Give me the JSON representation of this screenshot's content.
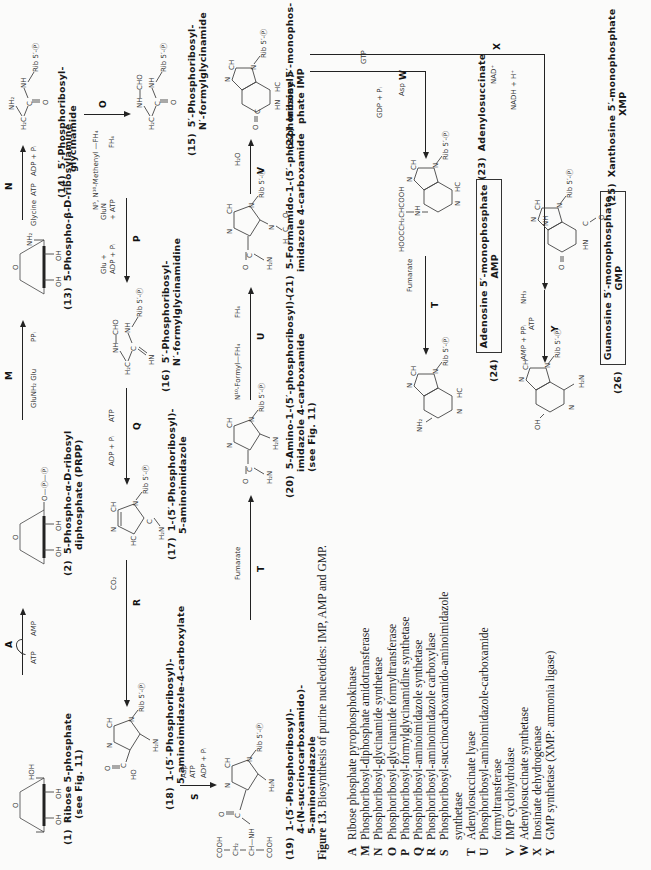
{
  "figure": {
    "number": "Figure 13.",
    "caption": "Biosynthesis of purine nucleotides: IMP, AMP and GMP.",
    "orientation": "page rotated 90° counter-clockwise"
  },
  "compounds": {
    "c1": {
      "num": "(1)",
      "line1": "Ribose 5-phosphate",
      "line2": "(see Fig. 11)"
    },
    "c2": {
      "num": "(2)",
      "line1": "5-Phospho-α-D-ribosyl",
      "line2": "diphosphate (PRPP)"
    },
    "c13": {
      "num": "(13)",
      "line1": "5-Phospho-β-D-ribosylamine"
    },
    "c14": {
      "num": "(14)",
      "line1": "5′-Phosphoribosyl-",
      "line2": "glycinamide"
    },
    "c15": {
      "num": "(15)",
      "line1": "5′-Phosphoribosyl-",
      "line2": "N′-formylglycinamide"
    },
    "c16": {
      "num": "(16)",
      "line1": "5′-Phosphoribosyl-",
      "line2": "N′-formylglycinamidine"
    },
    "c17": {
      "num": "(17)",
      "line1": "1-(5′-Phosphoribosyl)-",
      "line2": "5-aminoimidazole"
    },
    "c18": {
      "num": "(18)",
      "line1": "1-(5′-Phosphoribosyl)-",
      "line2": "5-aminoimidazole-4-carboxylate"
    },
    "c19": {
      "num": "(19)",
      "line1": "1-(5′-Phosphoribosyl)-",
      "line2": "4-(N-succinocarboxamido)-",
      "line3": "5-aminoimidazole"
    },
    "c20": {
      "num": "(20)",
      "line1": "5-Amino-1-(5′-phosphoribosyl)-",
      "line2": "imidazole 4-carboxamide",
      "line3": "(see Fig. 11)"
    },
    "c21": {
      "num": "(21)",
      "line1": "5-Formamido-1-(5′-phosphoribosyl)-",
      "line2": "imidazole 4-carboxamide"
    },
    "c22": {
      "num": "(22)",
      "line1": "Inosine 5′-monophos-",
      "line2": "phate IMP"
    },
    "c23": {
      "num": "(23)",
      "line1": "Adenylosuccinate"
    },
    "c24": {
      "num": "(24)",
      "line1": "Adenosine 5′-monophosphate",
      "line2": "AMP"
    },
    "c25": {
      "num": "(25)",
      "line1": "Xanthosine 5′-monophosphate",
      "line2": "XMP"
    },
    "c26": {
      "num": "(26)",
      "line1": "Guanosine 5′-monophosphate",
      "line2": "GMP"
    }
  },
  "reactions": {
    "A": {
      "enzyme": "A",
      "in": "ATP",
      "out": "AMP"
    },
    "M": {
      "enzyme": "M",
      "in": "GluNH₂",
      "in2": "Glu",
      "out": "PPᵢ"
    },
    "N": {
      "enzyme": "N",
      "in": "Glycine",
      "in2": "ATP",
      "out": "ADP + Pᵢ"
    },
    "O": {
      "enzyme": "O",
      "in": "N⁵, N¹⁰-Methenyl —FH₄",
      "out": "FH₄"
    },
    "P": {
      "enzyme": "P",
      "in": "GluN",
      "in2": "+ ATP",
      "out": "Glu +",
      "out2": "ADP + Pᵢ"
    },
    "Q": {
      "enzyme": "Q",
      "in": "ATP",
      "out": "ADP + Pᵢ"
    },
    "R": {
      "enzyme": "R",
      "in": "CO₂"
    },
    "S": {
      "enzyme": "S",
      "in": "Asp",
      "in2": "ATP",
      "out": "ADP + Pᵢ"
    },
    "T1": {
      "enzyme": "T",
      "out": "Fumarate"
    },
    "U": {
      "enzyme": "U",
      "in": "N¹⁰-Formyl—FH₄",
      "out": "FH₄"
    },
    "V": {
      "enzyme": "V",
      "out": "H₂O"
    },
    "W": {
      "enzyme": "W",
      "in": "Asp",
      "in2": "GTP",
      "out": "GDP + Pᵢ"
    },
    "T2": {
      "enzyme": "T",
      "out": "Fumarate"
    },
    "X": {
      "enzyme": "X",
      "in": "NAD⁺",
      "out": "NADH + H⁺"
    },
    "Y": {
      "enzyme": "Y",
      "in": "ATP",
      "in2": "NH₃",
      "out": "AMP + PPᵢ"
    }
  },
  "structure_labels": {
    "rib": "Rib 5′-Ⓟ",
    "nh2": "NH₂",
    "h2n": "H₂N",
    "oh": "OH",
    "hoh": "HOH",
    "cho": "CHO",
    "nh": "NH",
    "hn": "HN",
    "ch": "CH",
    "n": "N",
    "o": "O",
    "c": "C",
    "hc": "HC",
    "h2c": "H₂C",
    "cooh": "COOH",
    "ch2": "CH₂",
    "ch_nh": "CH—NH",
    "ho": "HO",
    "h": "H",
    "succ": "HOOCCH₂CHCOOH",
    "p_circle": "Ⓟ",
    "o_p_p": "O—Ⓟ—Ⓟ"
  },
  "legend": [
    {
      "key": "A",
      "text": "Ribose phosphate pyrophosphokinase"
    },
    {
      "key": "M",
      "text": "Phosphoribosyl-diphosphate amidotransferase"
    },
    {
      "key": "N",
      "text": "Phosphoribosyl-glycinamide synthetase"
    },
    {
      "key": "O",
      "text": "Phosphoribosyl-glycinamide formyltransferase"
    },
    {
      "key": "P",
      "text": "Phosphoribosyl-formylglycinamidine synthetase"
    },
    {
      "key": "Q",
      "text": "Phosphoribosyl-aminoimidazole synthetase"
    },
    {
      "key": "R",
      "text": "Phosphoribosyl-aminoimidazole carboxylase"
    },
    {
      "key": "S",
      "text": "Phosphoribosyl-succinocarboxamido-aminoimidazole",
      "cont": "synthetase"
    },
    {
      "key": "T",
      "text": "Adenylosuccinate lyase"
    },
    {
      "key": "U",
      "text": "Phosphoribosyl-aminoimidazole-carboxamide",
      "cont": "formyltransferase"
    },
    {
      "key": "V",
      "text": "IMP cyclohydrolase"
    },
    {
      "key": "W",
      "text": "Adenylosuccinate synthetase"
    },
    {
      "key": "X",
      "text": "Inosinate dehydrogenase"
    },
    {
      "key": "Y",
      "text": "GMP synthetase (XMP: ammonia ligase)"
    }
  ]
}
